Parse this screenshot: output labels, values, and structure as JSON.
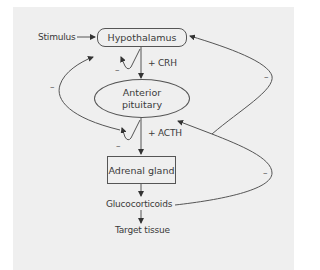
{
  "diagram": {
    "nodes": {
      "stimulus": "Stimulus",
      "hypothalamus": "Hypothalamus",
      "anterior_pituitary_line1": "Anterior",
      "anterior_pituitary_line2": "pituitary",
      "adrenal_gland": "Adrenal gland",
      "glucocorticoids": "Glucocorticoids",
      "target_tissue": "Target tissue"
    },
    "hormones": {
      "crh": "+ CRH",
      "acth": "+ ACTH"
    },
    "feedback_signs": {
      "crh_loop": "–",
      "acth_loop": "–",
      "left_long_loop": "–",
      "right_upper_loop": "–",
      "right_lower_loop": "–"
    },
    "colors": {
      "panel_bg": "#efefef",
      "line": "#555555",
      "text": "#3a3a3a"
    }
  }
}
